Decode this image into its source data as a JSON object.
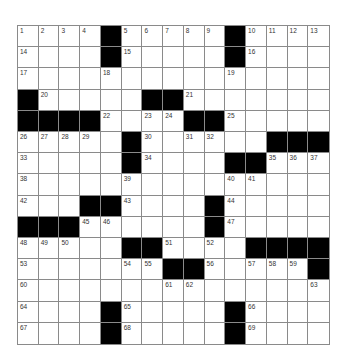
{
  "puzzle": {
    "rows": 15,
    "cols": 15,
    "grid": [
      "1 2 3 4 # 5 6 7 8 9 # 10 11 12 13",
      "14 . . . # 15 . . . . # 16 . . .",
      "17 . . . 18 . . . . . 19 . . . .",
      "# 20 . . . . # # 21 . . . . . .",
      "# # # # 22 . 23 24 # # 25 . . . .",
      "26 27 28 29 . # 30 . 31 32 . . # # #",
      "33 . . . . # 34 . . . # # 35 36 37",
      "38 . . . . 39 . . . . 40 41 . . .",
      "42 . . # # 43 . . . # 44 . . . .",
      "# # # 45 46 . . . . # 47 . . . .",
      "48 49 50 . . # # 51 . 52 . # # # #",
      "53 . . . . 54 55 # # 56 . 57 58 59 #",
      "60 . . . . . . 61 62 . . . . . 63",
      "64 . . . # 65 . . . . # 66 . . .",
      "67 . . . # 68 . . . . # 69 . . ."
    ],
    "colors": {
      "block": "#000000",
      "cell": "#ffffff",
      "line": "#8a8a8a",
      "number": "#333333"
    }
  }
}
